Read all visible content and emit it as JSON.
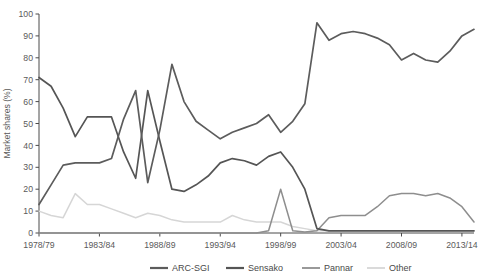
{
  "chart_data": {
    "type": "line",
    "title": "",
    "xlabel": "",
    "ylabel": "Market shares (%)",
    "ylim": [
      0,
      100
    ],
    "ytick_step": 10,
    "yticks": [
      0,
      10,
      20,
      30,
      40,
      50,
      60,
      70,
      80,
      90,
      100
    ],
    "grid": false,
    "legend_position": "bottom",
    "x_start_year": 1978,
    "x_end_year": 2015,
    "x": [
      "1978/79",
      "1979/80",
      "1980/81",
      "1981/82",
      "1982/83",
      "1983/84",
      "1984/85",
      "1985/86",
      "1986/87",
      "1987/88",
      "1988/89",
      "1989/90",
      "1990/91",
      "1991/92",
      "1992/93",
      "1993/94",
      "1994/95",
      "1995/96",
      "1996/97",
      "1997/98",
      "1998/99",
      "1999/00",
      "2000/01",
      "2001/02",
      "2002/03",
      "2003/04",
      "2004/05",
      "2005/06",
      "2006/07",
      "2007/08",
      "2008/09",
      "2009/10",
      "2010/11",
      "2011/12",
      "2012/13",
      "2013/14",
      "2014/15"
    ],
    "xticks": [
      "1978/79",
      "1983/84",
      "1988/89",
      "1993/94",
      "1998/99",
      "2003/04",
      "2008/09",
      "2013/14"
    ],
    "xtick_indices": [
      0,
      5,
      10,
      15,
      20,
      25,
      30,
      35
    ],
    "series": [
      {
        "name": "ARC-SGI",
        "color": "#5c5c5c",
        "width": 1.7,
        "values": [
          13,
          22,
          31,
          32,
          32,
          32,
          34,
          52,
          65,
          23,
          47,
          77,
          60,
          51,
          47,
          43,
          46,
          48,
          50,
          54,
          46,
          51,
          59,
          96,
          88,
          91,
          92,
          91,
          89,
          86,
          79,
          82,
          79,
          78,
          83,
          90,
          93
        ]
      },
      {
        "name": "Sensako",
        "color": "#555555",
        "width": 1.7,
        "values": [
          71,
          67,
          57,
          44,
          53,
          53,
          53,
          37,
          25,
          65,
          42,
          20,
          19,
          22,
          26,
          32,
          34,
          33,
          31,
          35,
          37,
          30,
          20,
          2,
          1,
          1,
          1,
          1,
          1,
          1,
          1,
          1,
          1,
          1,
          1,
          1,
          1
        ]
      },
      {
        "name": "Pannar",
        "color": "#8e8e8e",
        "width": 1.5,
        "values": [
          0,
          0,
          0,
          0,
          0,
          0,
          0,
          0,
          0,
          0,
          0,
          0,
          0,
          0,
          0,
          0,
          0,
          0,
          0,
          1,
          20,
          1,
          0.5,
          1,
          7,
          8,
          8,
          8,
          12,
          17,
          18,
          18,
          17,
          18,
          16,
          12,
          5
        ]
      },
      {
        "name": "Other",
        "color": "#d6d6d6",
        "width": 1.5,
        "values": [
          10,
          8,
          7,
          18,
          13,
          13,
          11,
          9,
          7,
          9,
          8,
          6,
          5,
          5,
          5,
          5,
          8,
          6,
          5,
          5,
          5,
          3,
          2,
          1,
          1,
          1,
          1,
          1,
          1,
          1,
          1,
          1,
          1,
          1,
          1,
          1,
          1
        ]
      }
    ],
    "legend": [
      {
        "label": "ARC-SGI",
        "color": "#5c5c5c"
      },
      {
        "label": "Sensako",
        "color": "#555555"
      },
      {
        "label": "Pannar",
        "color": "#8e8e8e"
      },
      {
        "label": "Other",
        "color": "#d6d6d6"
      }
    ]
  },
  "axes": {
    "axis_color": "#4a4a4a",
    "plot_left": 39,
    "plot_right": 474,
    "plot_top": 14,
    "plot_bottom": 233
  }
}
